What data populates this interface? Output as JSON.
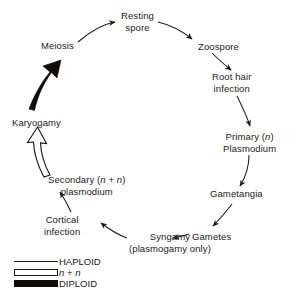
{
  "diagram": {
    "type": "cycle-flow-diagram",
    "background_color": "#ffffff",
    "ink_color": "#1a1a1a",
    "diploid_color": "#100c0a"
  },
  "nodes": {
    "meiosis": {
      "lines": [
        "Meiosis"
      ]
    },
    "resting_spore": {
      "lines": [
        "Resting",
        "spore"
      ]
    },
    "zoospore": {
      "lines": [
        "Zoospore"
      ]
    },
    "root_hair_infection": {
      "lines": [
        "Root hair",
        "infection"
      ]
    },
    "primary_plasmodium": {
      "line1_pre": "Primary (",
      "line1_italic": "n",
      "line1_post": ")",
      "line2": "Plasmodium"
    },
    "gametangia": {
      "lines": [
        "Gametangia"
      ]
    },
    "gametes": {
      "lines": [
        "Gametes"
      ]
    },
    "syngamy": {
      "line1": "Syngamy",
      "line2": "(plasmogamy only)"
    },
    "cortical_infection": {
      "lines": [
        "Cortical",
        "infection"
      ]
    },
    "secondary_plasmodium": {
      "line1_pre": "Secondary (",
      "line1_italic_a": "n",
      "line1_mid": " + ",
      "line1_italic_b": "n",
      "line1_post": ")",
      "line2": "plasmodium"
    },
    "karyogamy": {
      "lines": [
        "Karyogamy"
      ]
    }
  },
  "legend": {
    "items": [
      {
        "label": "HAPLOID",
        "style": "thin-line",
        "ploidy": "n"
      },
      {
        "label_pre": "",
        "label_italic_a": "n",
        "label_mid": " + ",
        "label_italic_b": "n",
        "style": "hollow-bar",
        "ploidy": "n + n"
      },
      {
        "label": "DIPLOID",
        "style": "filled-bar",
        "ploidy": "2n"
      }
    ]
  },
  "edges": [
    {
      "from": "meiosis",
      "to": "resting_spore",
      "style": "haploid"
    },
    {
      "from": "resting_spore",
      "to": "zoospore",
      "style": "haploid"
    },
    {
      "from": "zoospore",
      "to": "root_hair_infection",
      "style": "haploid"
    },
    {
      "from": "root_hair_infection",
      "to": "primary_plasmodium",
      "style": "haploid"
    },
    {
      "from": "primary_plasmodium",
      "to": "gametangia",
      "style": "haploid"
    },
    {
      "from": "gametangia",
      "to": "gametes",
      "style": "haploid"
    },
    {
      "from": "gametes",
      "to": "syngamy",
      "style": "haploid"
    },
    {
      "from": "syngamy",
      "to": "cortical_infection",
      "style": "haploid"
    },
    {
      "from": "cortical_infection",
      "to": "secondary_plasmodium",
      "style": "haploid"
    },
    {
      "from": "secondary_plasmodium",
      "to": "karyogamy",
      "style": "n-plus-n"
    },
    {
      "from": "karyogamy",
      "to": "meiosis",
      "style": "diploid"
    }
  ]
}
